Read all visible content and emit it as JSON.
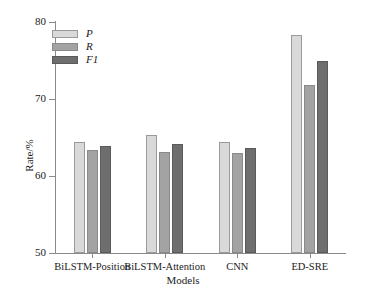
{
  "chart_data": {
    "type": "bar",
    "title": "",
    "xlabel": "Models",
    "ylabel": "Rate/%",
    "categories": [
      "BiLSTM-Position",
      "BiLSTM-Attention",
      "CNN",
      "ED-SRE"
    ],
    "series": [
      {
        "name": "P",
        "values": [
          64.4,
          65.3,
          64.4,
          78.3
        ],
        "color": "#d9d9d9"
      },
      {
        "name": "R",
        "values": [
          63.4,
          63.1,
          63.0,
          71.8
        ],
        "color": "#a3a3a3"
      },
      {
        "name": "F1",
        "values": [
          63.9,
          64.1,
          63.7,
          74.9
        ],
        "color": "#6e6e6e"
      }
    ],
    "ylim": [
      50,
      80
    ],
    "yticks": [
      50,
      60,
      70,
      80
    ],
    "ytick_labels": [
      "50",
      "60",
      "70",
      "80"
    ],
    "grid": false,
    "legend_position": "top-left",
    "legend_entries": [
      "P",
      "R",
      "F1"
    ]
  }
}
